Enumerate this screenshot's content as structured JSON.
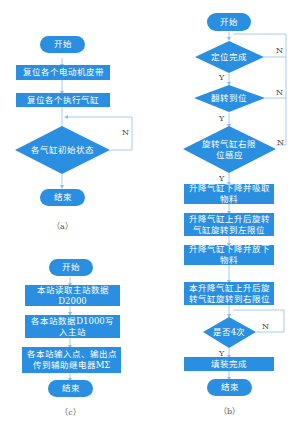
{
  "colors": {
    "shape_fill": "#2a8fe0",
    "line": "#8fbfe6",
    "text": "#ffffff",
    "caption": "#555555"
  },
  "diagram_a": {
    "caption": "（a）",
    "start": "开始",
    "step1": "复位各个电动机皮带",
    "step2": "复位各个执行气缸",
    "decision": "各气缸初始状态",
    "no_label": "N",
    "end": "结束"
  },
  "diagram_b": {
    "caption": "（b）",
    "start": "开始",
    "decision1": "定位完成",
    "decision2": "翻转到位",
    "decision3": "旋转气缸右限位感应",
    "step1": "升降气缸下降并吸取物料",
    "step2": "升降气缸上升后旋转气缸旋转到左限位",
    "step3": "升降气缸下降并放下物料",
    "step4": "本升降气缸上升后旋转气缸旋转到右限位",
    "decision4": "是否4次",
    "step5": "填装完成",
    "end": "结束",
    "yes_label": "Y",
    "no_label": "N"
  },
  "diagram_c": {
    "caption": "（c）",
    "start": "开始",
    "step1": "本站读取主站数据D2000",
    "step2": "各本站数据D1000写入主站",
    "step3": "各本站输入点、输出点传到辅助继电器MΣ",
    "end": "结束"
  }
}
